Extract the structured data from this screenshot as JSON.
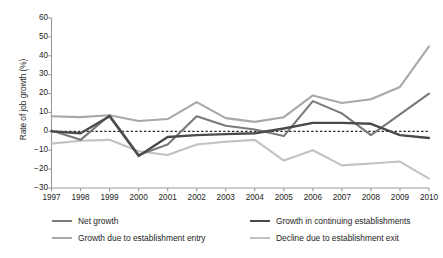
{
  "chart_data": {
    "type": "line",
    "title": "",
    "xlabel": "",
    "ylabel": "Rate of job growth (%)",
    "categories": [
      "1997",
      "1998",
      "1999",
      "2000",
      "2001",
      "2002",
      "2003",
      "2004",
      "2005",
      "2006",
      "2007",
      "2008",
      "2009",
      "2010"
    ],
    "x": [
      1997,
      1998,
      1999,
      2000,
      2001,
      2002,
      2003,
      2004,
      2005,
      2006,
      2007,
      2008,
      2009,
      2010
    ],
    "ylim": [
      -30,
      60
    ],
    "yticks": [
      60,
      50,
      40,
      30,
      20,
      10,
      0,
      -10,
      -20,
      -30
    ],
    "ytick_labels": [
      "60",
      "50",
      "40",
      "30",
      "20",
      "10",
      "0",
      "−10",
      "−20",
      "−30"
    ],
    "grid": false,
    "zero_line": true,
    "zero_line_style": "dashed",
    "legend_position": "below",
    "series": [
      {
        "name": "Net growth",
        "color": "#7a7a7a",
        "width": 2.1,
        "values": [
          0.5,
          -4.5,
          8.5,
          -12.5,
          -7.0,
          8.0,
          3.0,
          1.0,
          -2.5,
          16.0,
          9.5,
          -2.0,
          9.0,
          20.0
        ]
      },
      {
        "name": "Growth in continuing establishments",
        "color": "#4a4a4a",
        "width": 2.4,
        "values": [
          0.0,
          -1.0,
          8.0,
          -13.0,
          -3.0,
          -2.0,
          -1.5,
          -1.0,
          1.5,
          4.5,
          4.5,
          4.0,
          -2.0,
          -3.5
        ]
      },
      {
        "name": "Growth due to establishment entry",
        "color": "#a8a8a8",
        "width": 2.1,
        "values": [
          8.0,
          7.5,
          8.5,
          5.5,
          6.5,
          15.5,
          7.0,
          5.0,
          7.5,
          19.0,
          15.0,
          17.0,
          23.5,
          45.0
        ]
      },
      {
        "name": "Decline due to establishment exit",
        "color": "#c2c2c2",
        "width": 2.1,
        "values": [
          -6.5,
          -5.0,
          -4.5,
          -10.5,
          -12.5,
          -7.0,
          -5.5,
          -4.5,
          -15.5,
          -10.0,
          -18.0,
          -17.0,
          -16.0,
          -25.0
        ]
      }
    ]
  },
  "legend": {
    "rows": [
      [
        {
          "label": "Net growth",
          "color": "#7a7a7a",
          "width": 2.1
        },
        {
          "label": "Growth in continuing establishments",
          "color": "#4a4a4a",
          "width": 2.4
        }
      ],
      [
        {
          "label": "Growth due to establishment entry",
          "color": "#a8a8a8",
          "width": 2.1
        },
        {
          "label": "Decline due to establishment exit",
          "color": "#c2c2c2",
          "width": 2.1
        }
      ]
    ]
  },
  "axis": {
    "color": "#9a9a9a",
    "zero_line_color": "#2a2a2a"
  }
}
